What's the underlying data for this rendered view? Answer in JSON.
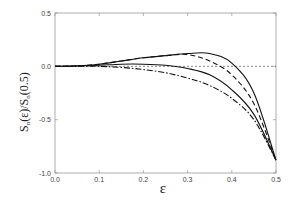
{
  "chart_data": {
    "type": "line",
    "title": "",
    "xlabel": "ε",
    "ylabel": "S_n(ε)/S_n(0.5)",
    "xlim": [
      0.0,
      0.5
    ],
    "ylim": [
      -1.0,
      0.5
    ],
    "xticks": [
      "0.0",
      "0.1",
      "0.2",
      "0.3",
      "0.4",
      "0.5"
    ],
    "yticks": [
      "0.5",
      "0.0",
      "-0.5",
      "-1.0"
    ],
    "grid": false,
    "legend": null,
    "x": [
      0.0,
      0.05,
      0.1,
      0.15,
      0.2,
      0.25,
      0.3,
      0.35,
      0.4,
      0.45,
      0.5
    ],
    "series": [
      {
        "name": "solid-upper",
        "style": "solid",
        "values": [
          0.0,
          0.005,
          0.02,
          0.05,
          0.08,
          0.1,
          0.12,
          0.12,
          0.03,
          -0.25,
          -0.88
        ]
      },
      {
        "name": "dashed",
        "style": "dashed",
        "values": [
          0.0,
          0.005,
          0.02,
          0.05,
          0.08,
          0.1,
          0.11,
          0.05,
          -0.08,
          -0.35,
          -0.88
        ]
      },
      {
        "name": "solid-lower",
        "style": "solid",
        "values": [
          0.0,
          0.003,
          0.01,
          0.02,
          0.02,
          0.01,
          -0.02,
          -0.08,
          -0.22,
          -0.45,
          -0.88
        ]
      },
      {
        "name": "dash-dot",
        "style": "dashdot",
        "values": [
          0.0,
          0.0,
          0.0,
          -0.01,
          -0.03,
          -0.06,
          -0.11,
          -0.18,
          -0.3,
          -0.5,
          -0.88
        ]
      }
    ],
    "reference_line": {
      "y": 0.0,
      "style": "dashed"
    }
  }
}
